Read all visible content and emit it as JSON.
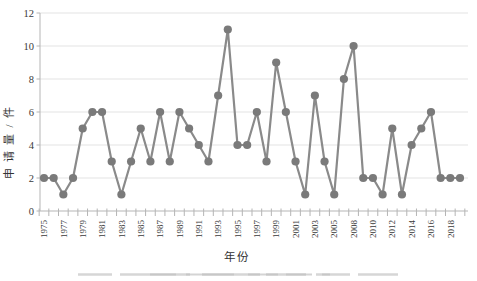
{
  "figure": {
    "background": "#ffffff",
    "caption_remnant": "faint top edge of cropped caption text below x-axis title"
  },
  "chart_data": {
    "type": "line",
    "title": "",
    "xlabel": "年份",
    "ylabel": "申请量/件",
    "years": [
      1975,
      1976,
      1977,
      1978,
      1979,
      1980,
      1981,
      1982,
      1983,
      1984,
      1985,
      1986,
      1987,
      1988,
      1989,
      1990,
      1991,
      1992,
      1993,
      1994,
      1995,
      1996,
      1997,
      1998,
      1999,
      2000,
      2001,
      2002,
      2003,
      2004,
      2005,
      2006,
      2008,
      2009,
      2010,
      2011,
      2012,
      2013,
      2014,
      2015,
      2016,
      2017,
      2018,
      2019
    ],
    "values": [
      2,
      2,
      1,
      2,
      5,
      6,
      6,
      3,
      1,
      3,
      5,
      3,
      6,
      3,
      6,
      5,
      4,
      3,
      7,
      11,
      4,
      4,
      6,
      3,
      9,
      6,
      3,
      1,
      7,
      3,
      1,
      8,
      10,
      2,
      2,
      1,
      5,
      1,
      4,
      5,
      6,
      2,
      2,
      2
    ],
    "x_tick_labels_shown": [
      "1975",
      "1977",
      "1979",
      "1981",
      "1983",
      "1985",
      "1987",
      "1989",
      "1991",
      "1993",
      "1995",
      "1997",
      "1999",
      "2001",
      "2003",
      "2005",
      "2008",
      "2010",
      "2012",
      "2014",
      "2016",
      "2018"
    ],
    "x_label_every": 2,
    "note_missing_year": "2007 absent from category axis",
    "ylim": [
      0,
      12
    ],
    "y_ticks": [
      0,
      2,
      4,
      6,
      8,
      10,
      12
    ],
    "grid": "horizontal major gridlines every 2 units",
    "legend": "none",
    "marker": "filled circle",
    "colors": {
      "line": "#8a8a8a",
      "marker": "#7a7a7a",
      "gridline": "#e3e3e3",
      "axis": "#b5b5b5",
      "text": "#3a3a3a",
      "remnant_light": "#d2d2d2",
      "remnant_dark": "#c2c2c2"
    }
  }
}
